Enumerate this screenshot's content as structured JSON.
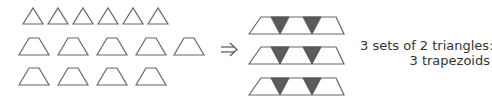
{
  "diagram": {
    "left_group": {
      "row1_triangles": 6,
      "row2_trapezoids": 5,
      "row3_trapezoids": 4
    },
    "arrow": "⇒",
    "right_group": {
      "composite_trapezoids": 3,
      "shaded_triangles_per_row": 2,
      "shade_color": "#5a5a5a"
    },
    "caption": {
      "line1": "3 sets of 2 triangles:",
      "line2": "3 trapezoids"
    },
    "colors": {
      "stroke": "#666666",
      "background": "#ffffff"
    }
  }
}
